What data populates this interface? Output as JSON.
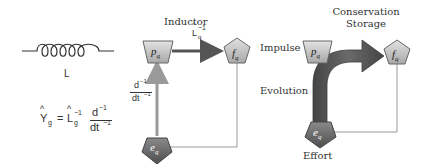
{
  "left_panel": {
    "inductor_symbol_label": "L",
    "equation": {
      "lhs_base": "Y",
      "lhs_hat": "^",
      "lhs_sub": "g",
      "equals": "=",
      "rhs_base": "L",
      "rhs_hat": "^",
      "rhs_sub": "g",
      "rhs_sup": "−1",
      "frac_num": "d",
      "frac_num_sup": "−1",
      "frac_den": "dt",
      "frac_den_sup": "−1"
    }
  },
  "middle_panel": {
    "title": "Inductor",
    "nodes": {
      "p": {
        "base": "p",
        "sub": "q"
      },
      "f": {
        "base": "f",
        "sub": "q"
      },
      "e": {
        "base": "e",
        "sub": "q"
      }
    },
    "horizontal_arrow_label": {
      "hat": "^",
      "base": "L",
      "sub": "q",
      "sup": "−1"
    },
    "vertical_arrow_label": {
      "num": "d",
      "num_sup": "−1",
      "den": "dt",
      "den_sup": "−1"
    }
  },
  "right_panel": {
    "title_line1": "Conservation",
    "title_line2": "Storage",
    "label_impulse": "Impulse",
    "label_evolution": "Evolution",
    "label_effort": "Effort",
    "nodes": {
      "p": {
        "base": "p",
        "sub": "q"
      },
      "f": {
        "base": "f",
        "sub": "q"
      },
      "e": {
        "base": "e",
        "sub": "q"
      }
    }
  },
  "colors": {
    "node_fill_light": "#c8c8c8",
    "node_fill_dark": "#6e6e6e",
    "arrow_dark": "#555555",
    "arrow_light": "#999999",
    "line": "#888888"
  }
}
